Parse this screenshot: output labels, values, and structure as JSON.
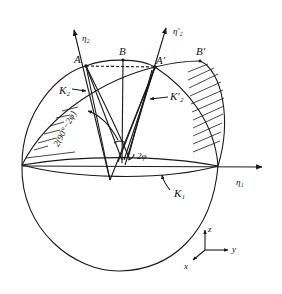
{
  "figure": {
    "labels": {
      "eta2": "η₂",
      "eta2_prime": "η′₂",
      "A": "A",
      "B": "B",
      "A_prime": "A′",
      "B_prime": "B′",
      "K2": "K₂",
      "K2_prime": "K′₂",
      "K1": "K₁",
      "eta1": "η₁",
      "angle_outer": "2(90°−2φ)",
      "angle_inner": "2φ"
    },
    "axes": {
      "z": "z",
      "y": "y",
      "x": "x"
    },
    "colors": {
      "ink": "#1a1a1a",
      "background": "#ffffff"
    }
  }
}
